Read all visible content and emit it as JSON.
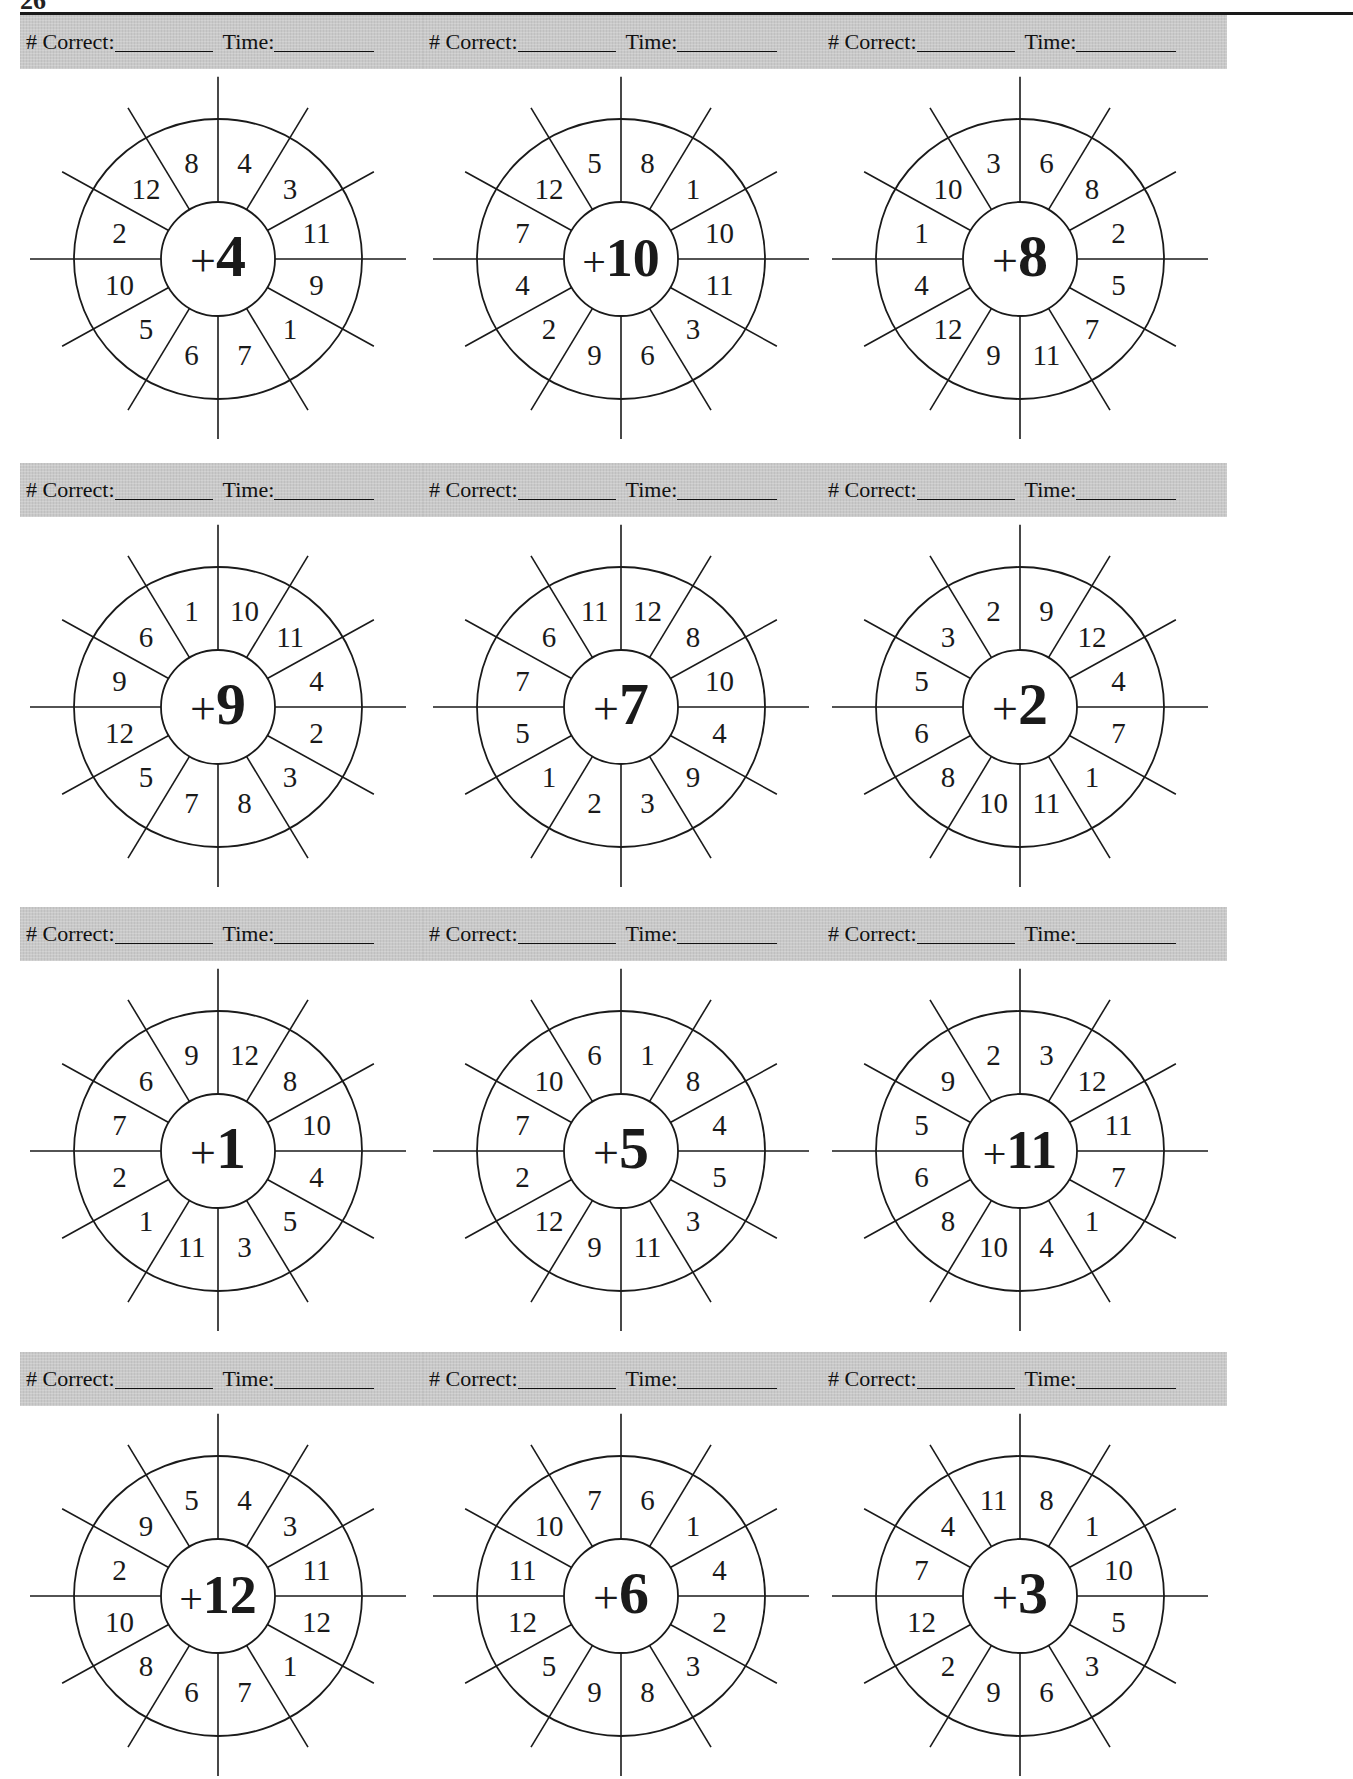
{
  "page": {
    "page_number_partial": "26",
    "header_labels": {
      "correct": "# Correct:",
      "time": "Time:"
    }
  },
  "worksheets": [
    {
      "operator": "+",
      "addend": "4",
      "numbers": [
        "4",
        "3",
        "11",
        "9",
        "1",
        "7",
        "6",
        "5",
        "10",
        "2",
        "12",
        "8"
      ]
    },
    {
      "operator": "+",
      "addend": "10",
      "numbers": [
        "8",
        "1",
        "10",
        "11",
        "3",
        "6",
        "9",
        "2",
        "4",
        "7",
        "12",
        "5"
      ]
    },
    {
      "operator": "+",
      "addend": "8",
      "numbers": [
        "6",
        "8",
        "2",
        "5",
        "7",
        "11",
        "9",
        "12",
        "4",
        "1",
        "10",
        "3"
      ]
    },
    {
      "operator": "+",
      "addend": "9",
      "numbers": [
        "10",
        "11",
        "4",
        "2",
        "3",
        "8",
        "7",
        "5",
        "12",
        "9",
        "6",
        "1"
      ]
    },
    {
      "operator": "+",
      "addend": "7",
      "numbers": [
        "12",
        "8",
        "10",
        "4",
        "9",
        "3",
        "2",
        "1",
        "5",
        "7",
        "6",
        "11"
      ]
    },
    {
      "operator": "+",
      "addend": "2",
      "numbers": [
        "9",
        "12",
        "4",
        "7",
        "1",
        "11",
        "10",
        "8",
        "6",
        "5",
        "3",
        "2"
      ]
    },
    {
      "operator": "+",
      "addend": "1",
      "numbers": [
        "12",
        "8",
        "10",
        "4",
        "5",
        "3",
        "11",
        "1",
        "2",
        "7",
        "6",
        "9"
      ]
    },
    {
      "operator": "+",
      "addend": "5",
      "numbers": [
        "1",
        "8",
        "4",
        "5",
        "3",
        "11",
        "9",
        "12",
        "2",
        "7",
        "10",
        "6"
      ]
    },
    {
      "operator": "+",
      "addend": "11",
      "numbers": [
        "3",
        "12",
        "11",
        "7",
        "1",
        "4",
        "10",
        "8",
        "6",
        "5",
        "9",
        "2"
      ]
    },
    {
      "operator": "+",
      "addend": "12",
      "numbers": [
        "4",
        "3",
        "11",
        "12",
        "1",
        "7",
        "6",
        "8",
        "10",
        "2",
        "9",
        "5"
      ]
    },
    {
      "operator": "+",
      "addend": "6",
      "numbers": [
        "6",
        "1",
        "4",
        "2",
        "3",
        "8",
        "9",
        "5",
        "12",
        "11",
        "10",
        "7"
      ]
    },
    {
      "operator": "+",
      "addend": "3",
      "numbers": [
        "8",
        "1",
        "10",
        "5",
        "3",
        "6",
        "9",
        "2",
        "12",
        "7",
        "4",
        "11"
      ]
    }
  ],
  "colors": {
    "header_bg": "#c9c9c9",
    "ink": "#1a1a1a",
    "paper": "#ffffff"
  }
}
